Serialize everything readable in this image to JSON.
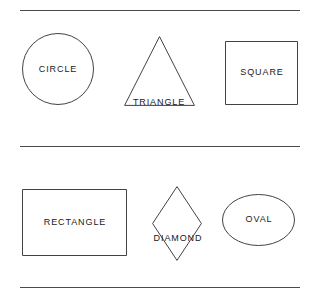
{
  "figure": {
    "background_color": "#ffffff",
    "stroke_color": "#434343",
    "label_color": "#1a1a1a"
  },
  "dividers": [
    {
      "name": "top",
      "y": 10,
      "x_start": 20,
      "x_end": 300
    },
    {
      "name": "middle",
      "y": 146,
      "x_start": 20,
      "x_end": 300
    },
    {
      "name": "bottom",
      "y": 287,
      "x_start": 20,
      "x_end": 300
    }
  ],
  "rows": [
    {
      "name": "row-1",
      "shapes": [
        {
          "id": "circle",
          "label": "CIRCLE",
          "type": "circle"
        },
        {
          "id": "triangle",
          "label": "TRIANGLE",
          "type": "triangle"
        },
        {
          "id": "square",
          "label": "SQUARE",
          "type": "square"
        }
      ]
    },
    {
      "name": "row-2",
      "shapes": [
        {
          "id": "rectangle",
          "label": "RECTANGLE",
          "type": "rectangle"
        },
        {
          "id": "diamond",
          "label": "DIAMOND",
          "type": "diamond"
        },
        {
          "id": "oval",
          "label": "OVAL",
          "type": "ellipse"
        }
      ]
    }
  ]
}
